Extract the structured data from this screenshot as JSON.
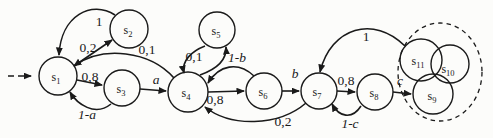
{
  "diagram": {
    "type": "state-transition-diagram",
    "colors": {
      "ink": "#1a1a1a",
      "background": "#fcfcfa"
    },
    "nodes": [
      {
        "id": "s1",
        "base": "s",
        "sub": "1"
      },
      {
        "id": "s2",
        "base": "s",
        "sub": "2"
      },
      {
        "id": "s3",
        "base": "s",
        "sub": "3"
      },
      {
        "id": "s4",
        "base": "s",
        "sub": "4"
      },
      {
        "id": "s5",
        "base": "s",
        "sub": "5"
      },
      {
        "id": "s6",
        "base": "s",
        "sub": "6"
      },
      {
        "id": "s7",
        "base": "s",
        "sub": "7"
      },
      {
        "id": "s8",
        "base": "s",
        "sub": "8"
      },
      {
        "id": "s9",
        "base": "s",
        "sub": "9"
      },
      {
        "id": "s10",
        "base": "s",
        "sub": "10"
      },
      {
        "id": "s11",
        "base": "s",
        "sub": "11"
      }
    ],
    "edges": [
      {
        "from": "s1",
        "to": "s2",
        "label": "0,2"
      },
      {
        "from": "s2",
        "to": "s1",
        "label": "1"
      },
      {
        "from": "s1",
        "to": "s3",
        "label": "0,8"
      },
      {
        "from": "s3",
        "to": "s1",
        "label": "1-a"
      },
      {
        "from": "s3",
        "to": "s4",
        "label": "a"
      },
      {
        "from": "s4",
        "to": "s1",
        "label": "0,1"
      },
      {
        "from": "s4",
        "to": "s5",
        "label": "0,1"
      },
      {
        "from": "s5",
        "to": "s4",
        "label": ""
      },
      {
        "from": "s4",
        "to": "s6",
        "label": "0,8"
      },
      {
        "from": "s6",
        "to": "s4",
        "label": "1-b"
      },
      {
        "from": "s6",
        "to": "s7",
        "label": "b"
      },
      {
        "from": "s7",
        "to": "s8",
        "label": "0,8"
      },
      {
        "from": "s8",
        "to": "s7",
        "label": "1-c"
      },
      {
        "from": "s8",
        "to": "s9",
        "label": "c"
      },
      {
        "from": "s7",
        "to": "s4",
        "label": "0,2"
      },
      {
        "from": "s11",
        "to": "s7",
        "label": "1"
      },
      {
        "from": "start",
        "to": "s1",
        "label": ""
      }
    ],
    "cluster": {
      "members": [
        "s9",
        "s10",
        "s11"
      ],
      "style": "dashed-ellipse"
    }
  }
}
